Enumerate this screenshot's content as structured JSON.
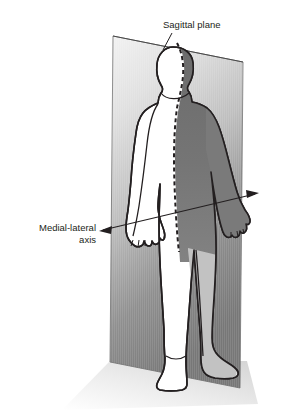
{
  "figure": {
    "background_color": "#ffffff",
    "width": 292,
    "height": 414
  },
  "labels": {
    "sagittal_plane": "Sagittal plane",
    "medial_lateral_line1": "Medial-lateral",
    "medial_lateral_line2": "axis"
  },
  "colors": {
    "outline": "#231f20",
    "text": "#231f20",
    "plane_light": "#ededed",
    "plane_mid": "#b9b9b9",
    "plane_dark": "#7c7c7c",
    "body_light": "#ffffff",
    "body_shaded": "#6e6e6e",
    "body_leg_shaded": "#c9c9c9",
    "floor_shadow": "#e3e3e3",
    "arrow": "#231f20"
  },
  "elements": {
    "sagittal_plane_name": "sagittal-plane-rectangle",
    "body_name": "human-body-figure",
    "midline_name": "sagittal-midline-dashed",
    "axis_name": "medial-lateral-axis-arrow",
    "floor_name": "floor-shadow",
    "leader_name": "sagittal-plane-leader-line"
  }
}
